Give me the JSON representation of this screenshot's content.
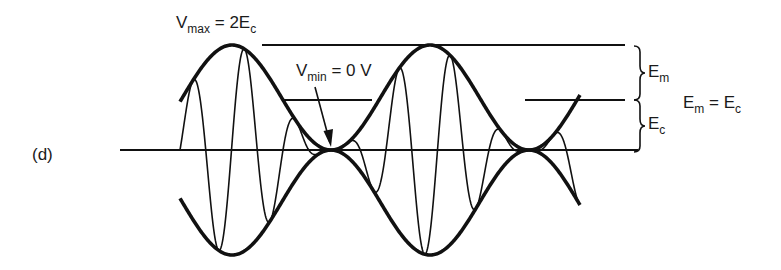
{
  "figure": {
    "panel_label": "(d)",
    "labels": {
      "vmax": {
        "symbol": "V",
        "sub": "max",
        "rest": " = 2E",
        "rest_sub": "c"
      },
      "vmin": {
        "symbol": "V",
        "sub": "min",
        "rest": " = 0 V"
      },
      "em_brace": {
        "symbol": "E",
        "sub": "m"
      },
      "ec_brace": {
        "symbol": "E",
        "sub": "c"
      },
      "equality": {
        "left": "E",
        "left_sub": "m",
        "eq": " = ",
        "right": "E",
        "right_sub": "c"
      }
    },
    "colors": {
      "stroke": "#111111",
      "background": "#ffffff"
    },
    "geometry": {
      "baseline_y": 150,
      "baseline_x": [
        120,
        638
      ],
      "top_ref_y": 45,
      "top_ref_x": [
        262,
        625
      ],
      "mid_ref_y": 100,
      "mid_ref_segments": [
        [
          282,
          372
        ],
        [
          525,
          625
        ]
      ],
      "envelope_amplitude": 105,
      "envelope_x_start": 180,
      "envelope_x_end": 580,
      "envelope_peak_x": [
        232,
        430
      ],
      "envelope_period": 198,
      "carrier_x_start": 180,
      "carrier_x_end": 578,
      "carrier_period": 51.5,
      "modulation_index": 1.0
    }
  }
}
